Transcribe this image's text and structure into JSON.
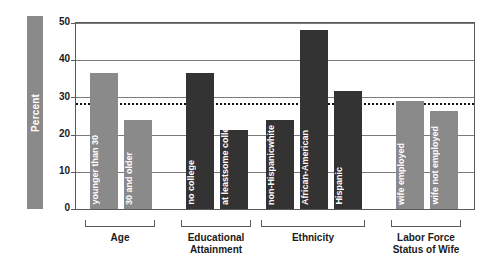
{
  "chart_data": {
    "type": "bar",
    "title": "",
    "xlabel": "",
    "ylabel": "Percent",
    "ylim": [
      0,
      50
    ],
    "yticks": [
      0,
      10,
      20,
      30,
      40,
      50
    ],
    "grid": true,
    "legend": "none",
    "reference_line": {
      "value": 28.5,
      "style": "dotted",
      "label": ""
    },
    "groups": [
      {
        "name": "Age",
        "categories": [
          "younger than 30",
          "30 and older"
        ],
        "values": [
          36.6,
          23.9
        ],
        "color": "#8a8a8a"
      },
      {
        "name": "Educational Attainment",
        "categories": [
          "no college",
          "at least\nsome college"
        ],
        "values": [
          36.5,
          21.2
        ],
        "color": "#333333"
      },
      {
        "name": "Ethnicity",
        "categories": [
          "non-Hispanic\nwhite",
          "African-American",
          "Hispanic"
        ],
        "values": [
          23.9,
          48.0,
          31.7
        ],
        "color": "#333333"
      },
      {
        "name": "Labor Force Status of Wife",
        "categories": [
          "wife employed",
          "wife not employed"
        ],
        "values": [
          29.0,
          26.3
        ],
        "color": "#8a8a8a"
      }
    ],
    "colors": {
      "bar_light": "#8a8a8a",
      "bar_dark": "#333333",
      "axis": "#5a5a5a",
      "text": "#1a1a1a",
      "reference_line": "#111111"
    }
  },
  "axis": {
    "y_title": "Percent",
    "ticks": [
      "50",
      "40",
      "30",
      "20",
      "10",
      "0"
    ]
  },
  "bars": [
    {
      "label_lines": [
        "younger than 30"
      ],
      "value": 36.6,
      "tone": "light"
    },
    {
      "label_lines": [
        "30 and older"
      ],
      "value": 23.9,
      "tone": "light"
    },
    {
      "label_lines": [
        "no college"
      ],
      "value": 36.5,
      "tone": "dark"
    },
    {
      "label_lines": [
        "at least",
        "some college"
      ],
      "value": 21.2,
      "tone": "dark"
    },
    {
      "label_lines": [
        "non-Hispanic",
        "white"
      ],
      "value": 23.9,
      "tone": "dark"
    },
    {
      "label_lines": [
        "African-American"
      ],
      "value": 48.0,
      "tone": "dark"
    },
    {
      "label_lines": [
        "Hispanic"
      ],
      "value": 31.7,
      "tone": "dark"
    },
    {
      "label_lines": [
        "wife employed"
      ],
      "value": 29.0,
      "tone": "light"
    },
    {
      "label_lines": [
        "wife not employed"
      ],
      "value": 26.3,
      "tone": "light"
    }
  ],
  "groups": [
    {
      "name": "Age",
      "lines": [
        "Age"
      ]
    },
    {
      "name": "Educational Attainment",
      "lines": [
        "Educational",
        "Attainment"
      ]
    },
    {
      "name": "Ethnicity",
      "lines": [
        "Ethnicity"
      ]
    },
    {
      "name": "Labor Force Status of Wife",
      "lines": [
        "Labor Force",
        "Status of Wife"
      ]
    }
  ]
}
